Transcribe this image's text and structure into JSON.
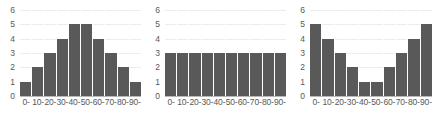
{
  "chart_data": [
    {
      "type": "bar",
      "title": "",
      "subtitle": "",
      "xlabel": "",
      "ylabel": "",
      "categories": [
        "0-",
        "10-",
        "20-",
        "30-",
        "40-",
        "50-",
        "60-",
        "70-",
        "80-",
        "90-"
      ],
      "values": [
        1,
        2,
        3,
        4,
        5,
        5,
        4,
        3,
        2,
        1
      ],
      "ylim": [
        0,
        6
      ],
      "yticks": [
        0,
        1,
        2,
        3,
        4,
        5,
        6
      ],
      "grid": true,
      "legend": null,
      "bar_color": "#595959",
      "grid_color": "#ececec",
      "axis_color": "#b8b8b8",
      "text_color": "#595959",
      "shape": "symmetric-unimodal"
    },
    {
      "type": "bar",
      "title": "",
      "subtitle": "",
      "xlabel": "",
      "ylabel": "",
      "categories": [
        "0-",
        "10-",
        "20-",
        "30-",
        "40-",
        "50-",
        "60-",
        "70-",
        "80-",
        "90-"
      ],
      "values": [
        3,
        3,
        3,
        3,
        3,
        3,
        3,
        3,
        3,
        3
      ],
      "ylim": [
        0,
        6
      ],
      "yticks": [
        0,
        1,
        2,
        3,
        4,
        5,
        6
      ],
      "grid": true,
      "legend": null,
      "bar_color": "#595959",
      "grid_color": "#ececec",
      "axis_color": "#b8b8b8",
      "text_color": "#595959",
      "shape": "uniform"
    },
    {
      "type": "bar",
      "title": "",
      "subtitle": "",
      "xlabel": "",
      "ylabel": "",
      "categories": [
        "0-",
        "10-",
        "20-",
        "30-",
        "40-",
        "50-",
        "60-",
        "70-",
        "80-",
        "90-"
      ],
      "values": [
        5,
        4,
        3,
        2,
        1,
        1,
        2,
        3,
        4,
        5
      ],
      "ylim": [
        0,
        6
      ],
      "yticks": [
        0,
        1,
        2,
        3,
        4,
        5,
        6
      ],
      "grid": true,
      "legend": null,
      "bar_color": "#595959",
      "grid_color": "#ececec",
      "axis_color": "#b8b8b8",
      "text_color": "#595959",
      "shape": "u-shaped-bimodal"
    }
  ]
}
